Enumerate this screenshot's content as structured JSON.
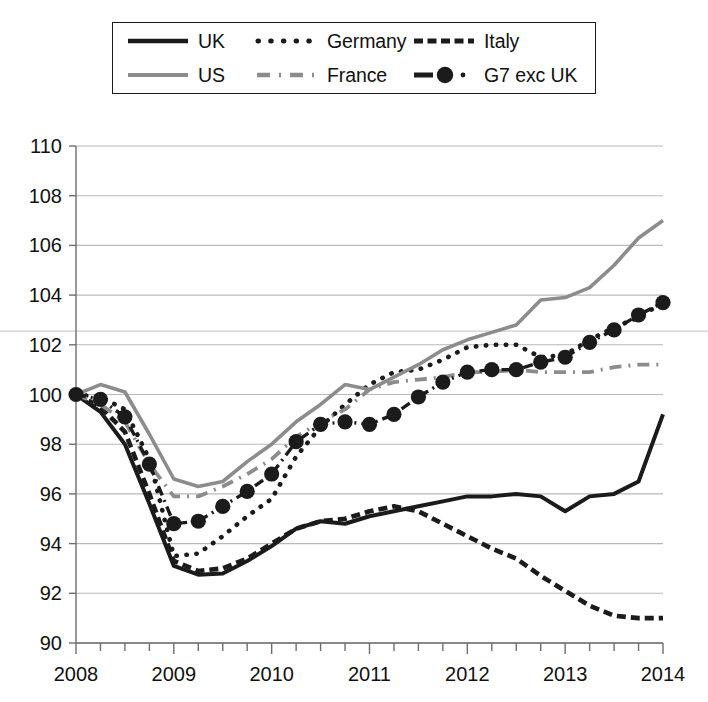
{
  "legend": {
    "rows": [
      [
        {
          "key": "uk",
          "label": "UK",
          "style": "solid-black"
        },
        {
          "key": "germany",
          "label": "Germany",
          "style": "dotted-black"
        },
        {
          "key": "italy",
          "label": "Italy",
          "style": "dashed-black"
        }
      ],
      [
        {
          "key": "us",
          "label": "US",
          "style": "solid-gray"
        },
        {
          "key": "france",
          "label": "France",
          "style": "dashdot-gray"
        },
        {
          "key": "g7",
          "label": "G7 exc UK",
          "style": "dashdot-marker-black"
        }
      ]
    ]
  },
  "colors": {
    "black": "#1b1b1b",
    "gray": "#8c8c8c",
    "grid": "#b9b9b9",
    "axis": "#6e6e6e",
    "background": "#ffffff"
  },
  "chart_data": {
    "type": "line",
    "title": "",
    "subtitle": "",
    "xlabel": "",
    "ylabel": "",
    "xlim": [
      2008.0,
      2014.0
    ],
    "ylim": [
      90,
      110
    ],
    "ytick_values": [
      90,
      92,
      94,
      96,
      98,
      100,
      102,
      104,
      106,
      108,
      110
    ],
    "ytick_labels": [
      "90",
      "92",
      "94",
      "96",
      "98",
      "100",
      "102",
      "104",
      "106",
      "108",
      "110"
    ],
    "xtick_values": [
      2008,
      2009,
      2010,
      2011,
      2012,
      2013,
      2014
    ],
    "xtick_labels": [
      "2008",
      "2009",
      "2010",
      "2011",
      "2012",
      "2013",
      "2014"
    ],
    "minor_xticks_per_year": 4,
    "grid": "horizontal",
    "legend_position": "above-plot",
    "index_base": "2008 Q1 = 100",
    "x": [
      2008.0,
      2008.25,
      2008.5,
      2008.75,
      2009.0,
      2009.25,
      2009.5,
      2009.75,
      2010.0,
      2010.25,
      2010.5,
      2010.75,
      2011.0,
      2011.25,
      2011.5,
      2011.75,
      2012.0,
      2012.25,
      2012.5,
      2012.75,
      2013.0,
      2013.25,
      2013.5,
      2013.75,
      2014.0
    ],
    "series": [
      {
        "name": "UK",
        "style": "solid-black",
        "color": "#1b1b1b",
        "markers": false,
        "values": [
          100.0,
          99.3,
          98.0,
          95.6,
          93.1,
          92.75,
          92.8,
          93.3,
          93.9,
          94.6,
          94.9,
          94.8,
          95.1,
          95.3,
          95.5,
          95.7,
          95.9,
          95.9,
          96.0,
          95.9,
          95.3,
          95.9,
          96.0,
          96.5,
          99.2
        ]
      },
      {
        "name": "Germany",
        "style": "dotted-black",
        "color": "#1b1b1b",
        "markers": false,
        "values": [
          100.0,
          99.9,
          99.4,
          97.4,
          93.5,
          93.6,
          94.3,
          95.1,
          95.8,
          97.5,
          98.7,
          99.6,
          100.4,
          100.9,
          101.0,
          101.4,
          101.9,
          102.0,
          102.0,
          101.5,
          101.6,
          102.2,
          102.7,
          103.1,
          103.7
        ]
      },
      {
        "name": "Italy",
        "style": "dashed-black",
        "color": "#1b1b1b",
        "markers": false,
        "values": [
          100.0,
          99.5,
          98.5,
          96.0,
          93.3,
          92.9,
          93.0,
          93.4,
          94.0,
          94.6,
          94.9,
          95.0,
          95.3,
          95.5,
          95.3,
          94.8,
          94.3,
          93.8,
          93.4,
          92.7,
          92.1,
          91.5,
          91.1,
          91.0,
          91.0
        ]
      },
      {
        "name": "US",
        "style": "solid-gray",
        "color": "#8c8c8c",
        "markers": false,
        "values": [
          100.0,
          100.4,
          100.1,
          98.4,
          96.6,
          96.3,
          96.5,
          97.3,
          98.0,
          98.9,
          99.6,
          100.4,
          100.2,
          100.7,
          101.2,
          101.8,
          102.2,
          102.5,
          102.8,
          103.8,
          103.9,
          104.3,
          105.2,
          106.3,
          107.0
        ]
      },
      {
        "name": "France",
        "style": "dashdot-gray",
        "color": "#8c8c8c",
        "markers": false,
        "values": [
          100.0,
          99.6,
          98.9,
          97.2,
          95.9,
          95.9,
          96.3,
          96.8,
          97.4,
          98.3,
          98.9,
          99.4,
          100.2,
          100.5,
          100.6,
          100.7,
          100.9,
          100.9,
          101.0,
          100.9,
          100.9,
          100.9,
          101.1,
          101.2,
          101.2
        ]
      },
      {
        "name": "G7 exc UK",
        "style": "dashdot-marker-black",
        "color": "#1b1b1b",
        "markers": true,
        "values": [
          100.0,
          99.8,
          99.1,
          97.2,
          94.8,
          94.9,
          95.5,
          96.1,
          96.8,
          98.1,
          98.8,
          98.9,
          98.8,
          99.2,
          99.9,
          100.5,
          100.9,
          101.0,
          101.0,
          101.3,
          101.5,
          102.1,
          102.6,
          103.2,
          103.7
        ]
      }
    ]
  }
}
